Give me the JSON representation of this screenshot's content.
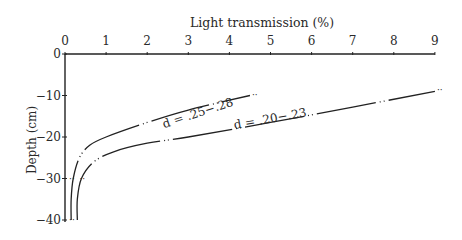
{
  "chart_data": {
    "type": "line",
    "title": "",
    "xlabel": "Light transmission (%)",
    "ylabel": "Depth (cm)",
    "xlim": [
      0,
      9
    ],
    "ylim": [
      -40,
      0
    ],
    "x_ticks": [
      "0",
      "1",
      "2",
      "3",
      "4",
      "5",
      "6",
      "7",
      "8",
      "9"
    ],
    "y_ticks": [
      "0",
      "−10",
      "−20",
      "−30",
      "−40"
    ],
    "x_axis_position": "top",
    "grid": false,
    "legend": null,
    "series": [
      {
        "name": "d = .25−.28",
        "x": [
          0.15,
          0.15,
          0.2,
          0.35,
          0.6,
          1.0,
          2.0,
          3.0,
          4.5
        ],
        "y": [
          -40,
          -35,
          -30,
          -25,
          -22,
          -20,
          -16.5,
          -13.5,
          -10
        ]
      },
      {
        "name": "d = .20−.23",
        "x": [
          0.3,
          0.3,
          0.4,
          0.7,
          1.2,
          2.0,
          3.0,
          5.0,
          7.0,
          9.0
        ],
        "y": [
          -40,
          -35,
          -30,
          -26,
          -23.5,
          -21.5,
          -20,
          -16.5,
          -12.8,
          -9
        ]
      }
    ],
    "annotations": [
      {
        "text": "d = .25−.28",
        "near": "upper curve, x≈2.5"
      },
      {
        "text": "d = .20−.23",
        "near": "lower curve, x≈5"
      }
    ]
  },
  "labels": {
    "xlabel": "Light transmission (%)",
    "ylabel": "Depth (cm)",
    "curve1": "d = .25−.28",
    "curve2": "d = .20−.23"
  }
}
